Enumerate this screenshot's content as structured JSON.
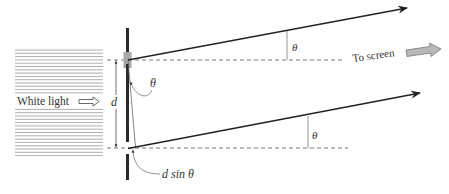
{
  "figure": {
    "labels": {
      "white_light": "White light",
      "to_screen": "To screen",
      "d": "d",
      "theta_slit": "θ",
      "theta_top_ray": "θ",
      "theta_bottom_ray": "θ",
      "path_difference": "d sin θ"
    },
    "colors": {
      "ray": "#222222",
      "barrier": "#2a2a2a",
      "slit_highlight": "#a8a8a8",
      "dashed": "#555555",
      "light_lines": "#9a9a9a",
      "screen_arrow_fill": "#b8b8b8"
    }
  }
}
